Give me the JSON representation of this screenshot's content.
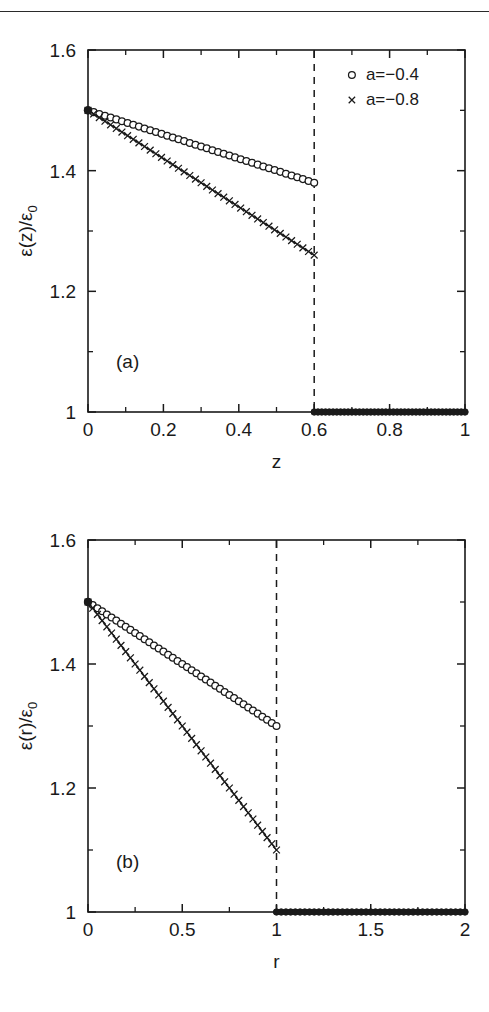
{
  "page": {
    "has_header_rule": true,
    "background": "#ffffff",
    "ink": "#1a1a1a"
  },
  "chart_data": [
    {
      "id": "panel-a",
      "type": "line",
      "panel_label": "(a)",
      "title": "",
      "xlabel": "z",
      "ylabel": "ε(z)/ε₀",
      "ylabel_parts": {
        "eps": "ε",
        "arg": "(z)/",
        "eps2": "ε",
        "sub": "0"
      },
      "xlim": [
        0,
        1
      ],
      "ylim": [
        1,
        1.6
      ],
      "xticks": [
        0,
        0.2,
        0.4,
        0.6,
        0.8,
        1
      ],
      "xticklabels": [
        "0",
        "0.2",
        "0.4",
        "0.6",
        "0.8",
        "1"
      ],
      "xminorticks": [
        0.1,
        0.3,
        0.5,
        0.7,
        0.9
      ],
      "yticks": [
        1,
        1.2,
        1.4,
        1.6
      ],
      "yticklabels": [
        "1",
        "1.2",
        "1.4",
        "1.6"
      ],
      "yminorticks": [
        1.1,
        1.3,
        1.5
      ],
      "grid": false,
      "legend_position": "top-right",
      "annotations": [
        {
          "name": "interface-line",
          "type": "vline",
          "x": 0.6,
          "style": "dashed"
        }
      ],
      "series": [
        {
          "name": "a=-0.4",
          "marker": "circle",
          "x": [
            0.0,
            0.015,
            0.03,
            0.045,
            0.06,
            0.075,
            0.09,
            0.105,
            0.12,
            0.135,
            0.15,
            0.165,
            0.18,
            0.195,
            0.21,
            0.225,
            0.24,
            0.255,
            0.27,
            0.285,
            0.3,
            0.315,
            0.33,
            0.345,
            0.36,
            0.375,
            0.39,
            0.405,
            0.42,
            0.435,
            0.45,
            0.465,
            0.48,
            0.495,
            0.51,
            0.525,
            0.54,
            0.555,
            0.57,
            0.585,
            0.6
          ],
          "y": [
            1.5,
            1.497,
            1.494,
            1.491,
            1.488,
            1.485,
            1.482,
            1.479,
            1.476,
            1.473,
            1.47,
            1.467,
            1.464,
            1.461,
            1.458,
            1.455,
            1.452,
            1.449,
            1.446,
            1.443,
            1.44,
            1.437,
            1.434,
            1.431,
            1.428,
            1.425,
            1.422,
            1.419,
            1.416,
            1.413,
            1.41,
            1.407,
            1.404,
            1.401,
            1.398,
            1.395,
            1.392,
            1.389,
            1.386,
            1.383,
            1.38
          ]
        },
        {
          "name": "a=-0.8",
          "marker": "cross",
          "x": [
            0.0,
            0.015,
            0.03,
            0.045,
            0.06,
            0.075,
            0.09,
            0.105,
            0.12,
            0.135,
            0.15,
            0.165,
            0.18,
            0.195,
            0.21,
            0.225,
            0.24,
            0.255,
            0.27,
            0.285,
            0.3,
            0.315,
            0.33,
            0.345,
            0.36,
            0.375,
            0.39,
            0.405,
            0.42,
            0.435,
            0.45,
            0.465,
            0.48,
            0.495,
            0.51,
            0.525,
            0.54,
            0.555,
            0.57,
            0.585,
            0.6
          ],
          "y": [
            1.5,
            1.494,
            1.488,
            1.482,
            1.476,
            1.47,
            1.464,
            1.458,
            1.452,
            1.446,
            1.44,
            1.434,
            1.428,
            1.422,
            1.416,
            1.41,
            1.404,
            1.398,
            1.392,
            1.386,
            1.38,
            1.374,
            1.368,
            1.362,
            1.356,
            1.35,
            1.344,
            1.338,
            1.332,
            1.326,
            1.32,
            1.314,
            1.308,
            1.302,
            1.296,
            1.29,
            1.284,
            1.278,
            1.272,
            1.266,
            1.26
          ]
        },
        {
          "name": "outside-region",
          "marker": "filled",
          "x": [
            0.6,
            0.61,
            0.62,
            0.63,
            0.64,
            0.65,
            0.66,
            0.67,
            0.68,
            0.69,
            0.7,
            0.71,
            0.72,
            0.73,
            0.74,
            0.75,
            0.76,
            0.77,
            0.78,
            0.79,
            0.8,
            0.81,
            0.82,
            0.83,
            0.84,
            0.85,
            0.86,
            0.87,
            0.88,
            0.89,
            0.9,
            0.91,
            0.92,
            0.93,
            0.94,
            0.95,
            0.96,
            0.97,
            0.98,
            0.99,
            1.0
          ],
          "y": [
            1,
            1,
            1,
            1,
            1,
            1,
            1,
            1,
            1,
            1,
            1,
            1,
            1,
            1,
            1,
            1,
            1,
            1,
            1,
            1,
            1,
            1,
            1,
            1,
            1,
            1,
            1,
            1,
            1,
            1,
            1,
            1,
            1,
            1,
            1,
            1,
            1,
            1,
            1,
            1,
            1
          ]
        }
      ],
      "legend": [
        {
          "marker": "circle",
          "label": "a=−0.4"
        },
        {
          "marker": "cross",
          "label": "a=−0.8"
        }
      ]
    },
    {
      "id": "panel-b",
      "type": "line",
      "panel_label": "(b)",
      "title": "",
      "xlabel": "r",
      "ylabel": "ε(r)/ε₀",
      "ylabel_parts": {
        "eps": "ε",
        "arg": "(r)/",
        "eps2": "ε",
        "sub": "0"
      },
      "xlim": [
        0,
        2
      ],
      "ylim": [
        1,
        1.6
      ],
      "xticks": [
        0,
        0.5,
        1,
        1.5,
        2
      ],
      "xticklabels": [
        "0",
        "0.5",
        "1",
        "1.5",
        "2"
      ],
      "xminorticks": [
        0.25,
        0.75,
        1.25,
        1.75
      ],
      "yticks": [
        1,
        1.2,
        1.4,
        1.6
      ],
      "yticklabels": [
        "1",
        "1.2",
        "1.4",
        "1.6"
      ],
      "yminorticks": [
        1.1,
        1.3,
        1.5
      ],
      "grid": false,
      "legend_position": "none",
      "annotations": [
        {
          "name": "interface-line",
          "type": "vline",
          "x": 1.0,
          "style": "dashed"
        }
      ],
      "series": [
        {
          "name": "a=-0.4",
          "marker": "circle",
          "x": [
            0.0,
            0.025,
            0.05,
            0.075,
            0.1,
            0.125,
            0.15,
            0.175,
            0.2,
            0.225,
            0.25,
            0.275,
            0.3,
            0.325,
            0.35,
            0.375,
            0.4,
            0.425,
            0.45,
            0.475,
            0.5,
            0.525,
            0.55,
            0.575,
            0.6,
            0.625,
            0.65,
            0.675,
            0.7,
            0.725,
            0.75,
            0.775,
            0.8,
            0.825,
            0.85,
            0.875,
            0.9,
            0.925,
            0.95,
            0.975,
            1.0
          ],
          "y": [
            1.5,
            1.495,
            1.49,
            1.485,
            1.48,
            1.475,
            1.47,
            1.465,
            1.46,
            1.455,
            1.45,
            1.445,
            1.44,
            1.435,
            1.43,
            1.425,
            1.42,
            1.415,
            1.41,
            1.405,
            1.4,
            1.395,
            1.39,
            1.385,
            1.38,
            1.375,
            1.37,
            1.365,
            1.36,
            1.355,
            1.35,
            1.345,
            1.34,
            1.335,
            1.33,
            1.325,
            1.32,
            1.315,
            1.31,
            1.305,
            1.3
          ]
        },
        {
          "name": "a=-0.8",
          "marker": "cross",
          "x": [
            0.0,
            0.025,
            0.05,
            0.075,
            0.1,
            0.125,
            0.15,
            0.175,
            0.2,
            0.225,
            0.25,
            0.275,
            0.3,
            0.325,
            0.35,
            0.375,
            0.4,
            0.425,
            0.45,
            0.475,
            0.5,
            0.525,
            0.55,
            0.575,
            0.6,
            0.625,
            0.65,
            0.675,
            0.7,
            0.725,
            0.75,
            0.775,
            0.8,
            0.825,
            0.85,
            0.875,
            0.9,
            0.925,
            0.95,
            0.975,
            1.0
          ],
          "y": [
            1.5,
            1.49,
            1.48,
            1.47,
            1.46,
            1.45,
            1.44,
            1.43,
            1.42,
            1.41,
            1.4,
            1.39,
            1.38,
            1.37,
            1.36,
            1.35,
            1.34,
            1.33,
            1.32,
            1.31,
            1.3,
            1.29,
            1.28,
            1.27,
            1.26,
            1.25,
            1.24,
            1.23,
            1.22,
            1.21,
            1.2,
            1.19,
            1.18,
            1.17,
            1.16,
            1.15,
            1.14,
            1.13,
            1.12,
            1.11,
            1.1
          ]
        },
        {
          "name": "outside-region",
          "marker": "filled",
          "x": [
            1.0,
            1.025,
            1.05,
            1.075,
            1.1,
            1.125,
            1.15,
            1.175,
            1.2,
            1.225,
            1.25,
            1.275,
            1.3,
            1.325,
            1.35,
            1.375,
            1.4,
            1.425,
            1.45,
            1.475,
            1.5,
            1.525,
            1.55,
            1.575,
            1.6,
            1.625,
            1.65,
            1.675,
            1.7,
            1.725,
            1.75,
            1.775,
            1.8,
            1.825,
            1.85,
            1.875,
            1.9,
            1.925,
            1.95,
            1.975,
            2.0
          ],
          "y": [
            1,
            1,
            1,
            1,
            1,
            1,
            1,
            1,
            1,
            1,
            1,
            1,
            1,
            1,
            1,
            1,
            1,
            1,
            1,
            1,
            1,
            1,
            1,
            1,
            1,
            1,
            1,
            1,
            1,
            1,
            1,
            1,
            1,
            1,
            1,
            1,
            1,
            1,
            1,
            1,
            1
          ]
        }
      ],
      "legend": []
    }
  ]
}
